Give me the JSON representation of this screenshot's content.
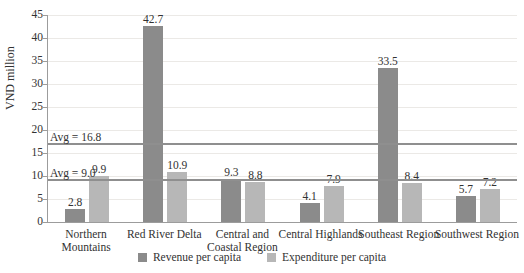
{
  "chart_data": {
    "type": "bar",
    "title": "",
    "ylabel": "VND million",
    "xlabel": "",
    "ylim": [
      0,
      45
    ],
    "ytick_step": 5,
    "grid": true,
    "legend_position": "bottom",
    "categories": [
      "Northern Mountains",
      "Red River Delta",
      "Central and Coastal Region",
      "Central Highlands",
      "Southeast Region",
      "Southwest Region"
    ],
    "series": [
      {
        "name": "Revenue per capita",
        "color": "#8b8b8b",
        "values": [
          2.8,
          42.7,
          9.3,
          4.1,
          33.5,
          5.7
        ]
      },
      {
        "name": "Expenditure per capita",
        "color": "#b7b7b7",
        "values": [
          9.9,
          10.9,
          8.8,
          7.9,
          8.4,
          7.2
        ]
      }
    ],
    "avg_lines": [
      {
        "label": "Avg = 16.8",
        "value": 16.8
      },
      {
        "label": "Avg = 9.0",
        "value": 9.0
      }
    ],
    "style_colors": {
      "gridline": "#ebe9e6",
      "axis": "#9c9c9c",
      "avg_line": "#8f8f8f",
      "text": "#323232"
    }
  }
}
